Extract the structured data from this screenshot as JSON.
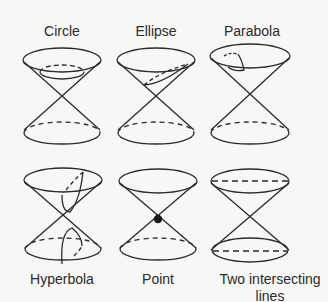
{
  "figure": {
    "panels": [
      {
        "label": "Circle",
        "section": "circle"
      },
      {
        "label": "Ellipse",
        "section": "ellipse"
      },
      {
        "label": "Parabola",
        "section": "parabola"
      },
      {
        "label": "Hyperbola",
        "section": "hyperbola"
      },
      {
        "label": "Point",
        "section": "point"
      },
      {
        "label": "Two intersecting",
        "label_line2": "lines",
        "section": "two-intersecting-lines"
      }
    ]
  },
  "colors": {
    "ink": "#2a2a2a",
    "background": "#f7f7f5"
  }
}
